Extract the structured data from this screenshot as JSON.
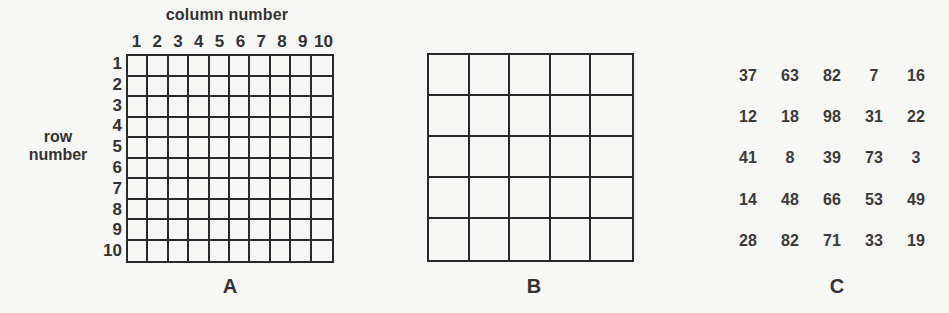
{
  "panels": {
    "A": {
      "label": "A",
      "column_axis_title": "column number",
      "row_axis_title_line1": "row",
      "row_axis_title_line2": "number",
      "columns": [
        "1",
        "2",
        "3",
        "4",
        "5",
        "6",
        "7",
        "8",
        "9",
        "10"
      ],
      "rows": [
        "1",
        "2",
        "3",
        "4",
        "5",
        "6",
        "7",
        "8",
        "9",
        "10"
      ],
      "grid_size": [
        10,
        10
      ]
    },
    "B": {
      "label": "B",
      "grid_size": [
        5,
        5
      ]
    },
    "C": {
      "label": "C",
      "values": [
        [
          "37",
          "63",
          "82",
          "7",
          "16"
        ],
        [
          "12",
          "18",
          "98",
          "31",
          "22"
        ],
        [
          "41",
          "8",
          "39",
          "73",
          "3"
        ],
        [
          "14",
          "48",
          "66",
          "53",
          "49"
        ],
        [
          "28",
          "82",
          "71",
          "33",
          "19"
        ]
      ]
    }
  },
  "colors": {
    "background": "#f7f7f5",
    "ink": "#2a2a2a"
  }
}
